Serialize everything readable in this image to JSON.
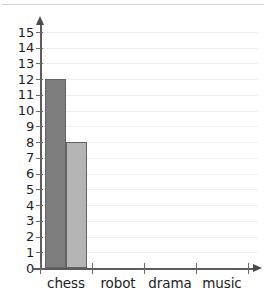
{
  "chart_data": {
    "type": "bar",
    "title": "",
    "subtitle": "",
    "xlabel": "",
    "ylabel": "",
    "categories": [
      "chess",
      "robot",
      "drama",
      "music"
    ],
    "series": [
      {
        "name": "series-1",
        "color": "#7d7d7d",
        "values": [
          12,
          null,
          null,
          null
        ]
      },
      {
        "name": "series-2",
        "color": "#b4b4b4",
        "values": [
          8,
          null,
          null,
          null
        ]
      }
    ],
    "ylim": [
      0,
      15
    ],
    "ytick_values": [
      0,
      1,
      2,
      3,
      4,
      5,
      6,
      7,
      8,
      9,
      10,
      11,
      12,
      13,
      14,
      15
    ],
    "ytick_labels": [
      "0",
      "1",
      "2",
      "3",
      "4",
      "5",
      "6",
      "7",
      "8",
      "9",
      "10",
      "11",
      "12",
      "13",
      "14",
      "15"
    ],
    "grid": true,
    "grid_axis": "y",
    "legend": false,
    "legend_position": "none",
    "axis_arrows": true,
    "annotations": []
  },
  "axes": {
    "y_axis_name": "y-axis",
    "x_axis_name": "x-axis"
  },
  "colors": {
    "bar_dark": "#7d7d7d",
    "bar_light": "#b4b4b4",
    "bar_outline": "#636363",
    "axis": "#5c5c5c",
    "gridline": "#eeeeee",
    "text": "#1d1d1d",
    "background": "#ffffff"
  }
}
